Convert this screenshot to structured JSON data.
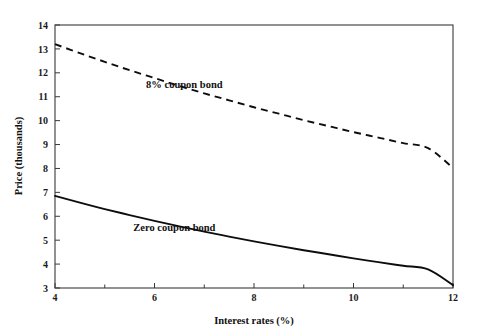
{
  "chart_data": {
    "type": "line",
    "title": "",
    "xlabel": "Interest rates (%)",
    "ylabel": "Price (thousands)",
    "xlim": [
      4,
      12
    ],
    "ylim": [
      3,
      14
    ],
    "grid": false,
    "legend_position": "inline-annotation",
    "x_ticks": [
      4,
      6,
      8,
      10,
      12
    ],
    "x_tick_labels": [
      "4",
      "6",
      "8",
      "10",
      "12"
    ],
    "x_minor_ticks": [
      5,
      7,
      9,
      11
    ],
    "y_ticks": [
      3,
      4,
      5,
      6,
      7,
      8,
      9,
      10,
      11,
      12,
      13,
      14
    ],
    "y_tick_labels": [
      "3",
      "4",
      "5",
      "6",
      "7",
      "8",
      "9",
      "10",
      "11",
      "12",
      "13",
      "14"
    ],
    "x": [
      4,
      4.5,
      5,
      5.5,
      6,
      6.5,
      7,
      7.5,
      8,
      8.5,
      9,
      9.5,
      10,
      10.5,
      11,
      11.5,
      12
    ],
    "series": [
      {
        "name": "8% coupon bond",
        "style": "dashed",
        "color": "#0d0d0d",
        "values": [
          13.2,
          12.82,
          12.46,
          12.11,
          11.78,
          11.45,
          11.14,
          10.85,
          10.56,
          10.29,
          10.02,
          9.77,
          9.52,
          9.29,
          9.06,
          8.85,
          8.02
        ]
      },
      {
        "name": "Zero coupon bond",
        "style": "solid",
        "color": "#0d0d0d",
        "values": [
          6.85,
          6.57,
          6.3,
          6.05,
          5.81,
          5.58,
          5.36,
          5.15,
          4.95,
          4.76,
          4.58,
          4.41,
          4.24,
          4.08,
          3.93,
          3.78,
          3.12
        ]
      }
    ],
    "annotations": [
      {
        "text": "8% coupon bond",
        "x": 6.6,
        "y": 11.35
      },
      {
        "text": "Zero coupon bond",
        "x": 6.4,
        "y": 5.4
      }
    ]
  },
  "axes": {
    "x_title": "Interest rates (%)",
    "y_title": "Price (thousands)"
  },
  "colors": {
    "background": "#ffffff",
    "axis": "#4a4a4a",
    "curve": "#0d0d0d",
    "text": "#111111"
  }
}
